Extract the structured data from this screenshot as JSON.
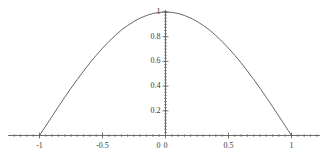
{
  "chart_data": {
    "type": "line",
    "title": "",
    "subtitle": "",
    "xlabel": "",
    "ylabel": "",
    "grid": false,
    "legend": false,
    "legend_position": "none",
    "xlim": [
      -1.15,
      1.15
    ],
    "ylim": [
      0,
      1.05
    ],
    "x_ticks": [
      -1,
      -0.5,
      0,
      0.5,
      1
    ],
    "x_tick_labels": [
      "-1",
      "-0.5",
      "0",
      "0.5",
      "1"
    ],
    "y_ticks": [
      0,
      0.2,
      0.4,
      0.6,
      0.8,
      1
    ],
    "y_tick_labels": [
      "0",
      "0.2",
      "0.4",
      "0.6",
      "0.8",
      "1"
    ],
    "y_axis_origin_label": "0",
    "series": [
      {
        "name": "curve",
        "color": "#555555",
        "x": [
          -1,
          -0.975,
          -0.95,
          -0.925,
          -0.9,
          -0.85,
          -0.8,
          -0.75,
          -0.7,
          -0.65,
          -0.6,
          -0.55,
          -0.5,
          -0.45,
          -0.4,
          -0.35,
          -0.3,
          -0.25,
          -0.2,
          -0.15,
          -0.1,
          -0.05,
          0,
          0.05,
          0.1,
          0.15,
          0.2,
          0.25,
          0.3,
          0.35,
          0.4,
          0.45,
          0.5,
          0.55,
          0.6,
          0.65,
          0.7,
          0.75,
          0.8,
          0.85,
          0.9,
          0.925,
          0.95,
          0.975,
          1
        ],
        "y": [
          0,
          0.039,
          0.078,
          0.117,
          0.156,
          0.233,
          0.309,
          0.383,
          0.454,
          0.522,
          0.588,
          0.649,
          0.707,
          0.76,
          0.809,
          0.854,
          0.891,
          0.924,
          0.951,
          0.972,
          0.988,
          0.997,
          1,
          0.997,
          0.988,
          0.972,
          0.951,
          0.924,
          0.891,
          0.854,
          0.809,
          0.76,
          0.707,
          0.649,
          0.588,
          0.522,
          0.454,
          0.383,
          0.309,
          0.233,
          0.156,
          0.117,
          0.078,
          0.039,
          0
        ]
      }
    ],
    "axis_color": "#6b6b6b",
    "curve_color": "#555555",
    "background_color": "#ffffff"
  },
  "axes": {
    "x_axis_name": "horizontal-axis",
    "y_axis_name": "vertical-axis"
  }
}
